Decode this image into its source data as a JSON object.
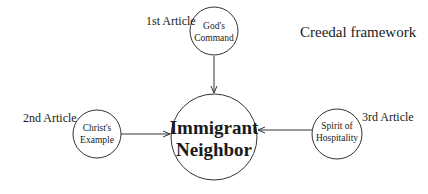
{
  "diagram": {
    "title": "Creedal framework",
    "center": {
      "line1": "Immigrant",
      "line2": "Neighbor"
    },
    "nodes": [
      {
        "article": "1st Article",
        "line1": "God's",
        "line2": "Command"
      },
      {
        "article": "2nd Article",
        "line1": "Christ's",
        "line2": "Example"
      },
      {
        "article": "3rd Article",
        "line1": "Spirit of",
        "line2": "Hospitality"
      }
    ],
    "colors": {
      "stroke": "#333333",
      "text": "#1a1a1a",
      "background": "#ffffff"
    }
  }
}
